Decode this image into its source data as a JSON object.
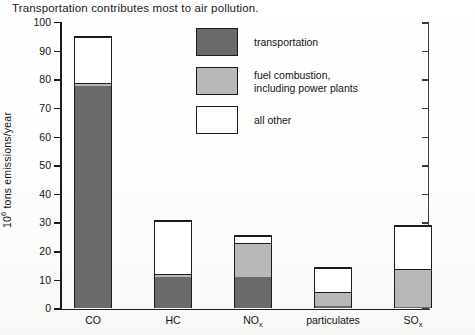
{
  "caption": "Transportation contributes most to air pollution.",
  "legend": {
    "items": [
      {
        "key": "transportation",
        "label": "transportation",
        "color": "#6a6a6a"
      },
      {
        "key": "fuel",
        "label": "fuel combustion,\nincluding power plants",
        "color": "#b8b8b8"
      },
      {
        "key": "other",
        "label": "all other",
        "color": "#ffffff"
      }
    ]
  },
  "axes": {
    "y_title_prefix": "10",
    "y_title_exponent": "6",
    "y_title_suffix": " tons emissions/year",
    "y_ticks": [
      "100",
      "90",
      "80",
      "70",
      "60",
      "50",
      "40",
      "30",
      "20",
      "10",
      "0"
    ]
  },
  "x_labels": [
    {
      "base": "CO",
      "sub": ""
    },
    {
      "base": "HC",
      "sub": ""
    },
    {
      "base": "NO",
      "sub": "x"
    },
    {
      "base": "particulates",
      "sub": ""
    },
    {
      "base": "SO",
      "sub": "x"
    }
  ],
  "chart_data": {
    "type": "bar",
    "title": "Transportation contributes most to air pollution.",
    "xlabel": "",
    "ylabel": "10^6 tons emissions/year",
    "ylim": [
      0,
      100
    ],
    "ytick_step": 10,
    "grid": false,
    "stacked": true,
    "legend_position": "inside-top-center",
    "categories": [
      "CO",
      "HC",
      "NOx",
      "particulates",
      "SOx"
    ],
    "series": [
      {
        "name": "transportation",
        "color": "#6a6a6a",
        "values": [
          78,
          11,
          11,
          1,
          0.5
        ]
      },
      {
        "name": "fuel combustion, including power plants",
        "color": "#b8b8b8",
        "values": [
          1,
          1,
          12,
          5,
          13.5
        ]
      },
      {
        "name": "all other",
        "color": "#ffffff",
        "values": [
          16,
          19,
          2.5,
          8.5,
          15
        ]
      }
    ],
    "totals": [
      95,
      31,
      25.5,
      14.5,
      29
    ]
  }
}
